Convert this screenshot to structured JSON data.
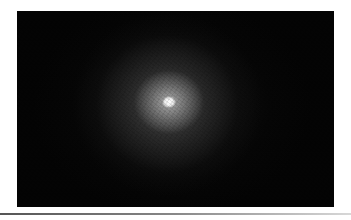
{
  "image": {
    "subject": "diffuse elliptical galaxy glow on black background",
    "alt": "Astronomical image of an elliptical galaxy with a bright core"
  },
  "colors": {
    "background": "#ffffff",
    "frame": "#040404",
    "core": "#ffffff"
  }
}
